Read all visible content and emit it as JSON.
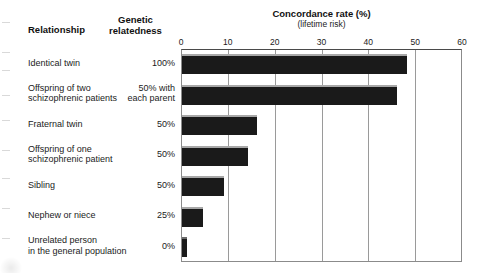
{
  "headers": {
    "relationship": "Relationship",
    "genetic_relatedness_line1": "Genetic",
    "genetic_relatedness_line2": "relatedness"
  },
  "chart_title": "Concordance rate (%)",
  "chart_subtitle": "(lifetime risk)",
  "axis": {
    "ticks": [
      "0",
      "10",
      "20",
      "30",
      "40",
      "50",
      "60"
    ]
  },
  "rows": [
    {
      "label_line1": "Identical twin",
      "label_line2": "",
      "relatedness_line1": "100%",
      "relatedness_line2": "",
      "value": 48
    },
    {
      "label_line1": "Offspring of two",
      "label_line2": "schizophrenic patients",
      "relatedness_line1": "50% with",
      "relatedness_line2": "each parent",
      "value": 46
    },
    {
      "label_line1": "Fraternal twin",
      "label_line2": "",
      "relatedness_line1": "50%",
      "relatedness_line2": "",
      "value": 16
    },
    {
      "label_line1": "Offspring of one",
      "label_line2": "schizophrenic patient",
      "relatedness_line1": "50%",
      "relatedness_line2": "",
      "value": 14
    },
    {
      "label_line1": "Sibling",
      "label_line2": "",
      "relatedness_line1": "50%",
      "relatedness_line2": "",
      "value": 9
    },
    {
      "label_line1": "Nephew or niece",
      "label_line2": "",
      "relatedness_line1": "25%",
      "relatedness_line2": "",
      "value": 4.5
    },
    {
      "label_line1": "Unrelated person",
      "label_line2": "in the general population",
      "relatedness_line1": "0%",
      "relatedness_line2": "",
      "value": 1
    }
  ],
  "chart_data": {
    "type": "bar",
    "orientation": "horizontal",
    "title": "Concordance rate (%)",
    "subtitle": "(lifetime risk)",
    "xlabel": "Concordance rate (%)",
    "ylabel": "Relationship",
    "xlim": [
      0,
      60
    ],
    "xticks": [
      0,
      10,
      20,
      30,
      40,
      50,
      60
    ],
    "grid": true,
    "legend": "none",
    "bar_color": "#1a1a1a",
    "categories": [
      "Identical twin",
      "Offspring of two schizophrenic patients",
      "Fraternal twin",
      "Offspring of one schizophrenic patient",
      "Sibling",
      "Nephew or niece",
      "Unrelated person in the general population"
    ],
    "values": [
      48,
      46,
      16,
      14,
      9,
      4.5,
      1
    ],
    "genetic_relatedness": [
      "100%",
      "50% with each parent",
      "50%",
      "50%",
      "50%",
      "25%",
      "0%"
    ]
  }
}
